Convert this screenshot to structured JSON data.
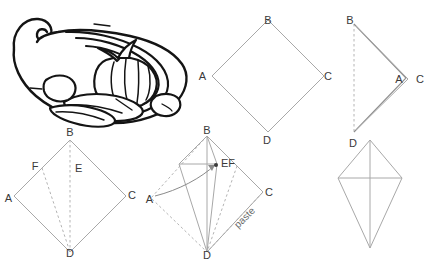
{
  "figure": {
    "kind": "origami-folding-instructions",
    "background_color": "#ffffff",
    "line_color": "#a8a8a8",
    "dashed_line_color": "#b4b4b4",
    "label_color": "#3a3a3a",
    "artwork_color": "#141414"
  },
  "panels": [
    {
      "id": "panel-illustration",
      "name": "finished-model-illustration",
      "labels": []
    },
    {
      "id": "panel-square",
      "name": "step-1-square-diamond",
      "labels": [
        {
          "text": "B",
          "x": 268,
          "y": 24
        },
        {
          "text": "A",
          "x": 206,
          "y": 80
        },
        {
          "text": "C",
          "x": 324,
          "y": 80
        },
        {
          "text": "D",
          "x": 267,
          "y": 136
        }
      ]
    },
    {
      "id": "panel-folded",
      "name": "step-2-folded-in-half",
      "labels": [
        {
          "text": "B",
          "x": 350,
          "y": 24
        },
        {
          "text": "A",
          "x": 399,
          "y": 79
        },
        {
          "text": "C",
          "x": 420,
          "y": 79
        },
        {
          "text": "D",
          "x": 352,
          "y": 145
        }
      ]
    },
    {
      "id": "panel-creases",
      "name": "step-3-crease-lines-ef",
      "labels": [
        {
          "text": "B",
          "x": 66,
          "y": 138
        },
        {
          "text": "F",
          "x": 35,
          "y": 170
        },
        {
          "text": "E",
          "x": 74,
          "y": 172
        },
        {
          "text": "A",
          "x": 12,
          "y": 202
        },
        {
          "text": "C",
          "x": 122,
          "y": 196
        },
        {
          "text": "D",
          "x": 66,
          "y": 253
        }
      ]
    },
    {
      "id": "panel-paste",
      "name": "step-4-fold-and-paste",
      "labels": [
        {
          "text": "B",
          "x": 207,
          "y": 135
        },
        {
          "text": "EF",
          "x": 214,
          "y": 167
        },
        {
          "text": "A",
          "x": 156,
          "y": 199
        },
        {
          "text": "C",
          "x": 266,
          "y": 192
        },
        {
          "text": "D",
          "x": 207,
          "y": 252
        }
      ],
      "annotations": [
        {
          "text": "paste",
          "x": 247,
          "y": 218,
          "rotation": -45
        }
      ]
    },
    {
      "id": "panel-result",
      "name": "step-5-finished-kite-shape",
      "labels": []
    }
  ]
}
